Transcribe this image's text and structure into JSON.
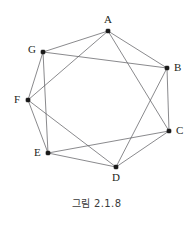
{
  "figure": {
    "caption": "그림 2.1.8",
    "colors": {
      "edge": "#58585b",
      "vertex": "#1a1a1a",
      "label": "#231f20",
      "background": "#ffffff"
    }
  },
  "graph": {
    "type": "undirected-simple-graph",
    "vertex_count": 7,
    "edge_count": 14,
    "degree_sequence": [
      4,
      4,
      4,
      4,
      4,
      4,
      4
    ],
    "vertices": [
      {
        "id": "A",
        "label": "A",
        "x": 108,
        "y": 31,
        "label_x": 104,
        "label_y": 14
      },
      {
        "id": "B",
        "label": "B",
        "x": 167,
        "y": 68,
        "label_x": 174,
        "label_y": 62
      },
      {
        "id": "C",
        "label": "C",
        "x": 169,
        "y": 131,
        "label_x": 176,
        "label_y": 125
      },
      {
        "id": "D",
        "label": "D",
        "x": 116,
        "y": 167,
        "label_x": 112,
        "label_y": 172
      },
      {
        "id": "E",
        "label": "E",
        "x": 48,
        "y": 153,
        "label_x": 34,
        "label_y": 147
      },
      {
        "id": "F",
        "label": "F",
        "x": 28,
        "y": 100,
        "label_x": 14,
        "label_y": 94
      },
      {
        "id": "G",
        "label": "G",
        "x": 43,
        "y": 52,
        "label_x": 28,
        "label_y": 44
      }
    ],
    "edges": [
      {
        "from": "A",
        "to": "B"
      },
      {
        "from": "B",
        "to": "C"
      },
      {
        "from": "C",
        "to": "D"
      },
      {
        "from": "D",
        "to": "E"
      },
      {
        "from": "E",
        "to": "F"
      },
      {
        "from": "F",
        "to": "G"
      },
      {
        "from": "G",
        "to": "A"
      },
      {
        "from": "A",
        "to": "C"
      },
      {
        "from": "B",
        "to": "D"
      },
      {
        "from": "C",
        "to": "E"
      },
      {
        "from": "D",
        "to": "F"
      },
      {
        "from": "E",
        "to": "G"
      },
      {
        "from": "F",
        "to": "A"
      },
      {
        "from": "G",
        "to": "B"
      }
    ]
  }
}
